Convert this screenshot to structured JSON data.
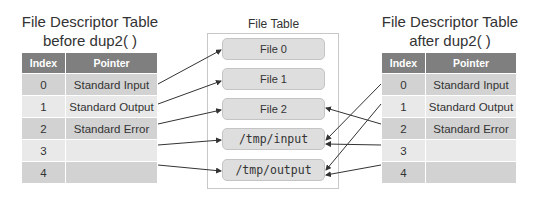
{
  "left_table": {
    "title_line1": "File Descriptor Table",
    "title_line2": "before dup2( )",
    "headers": {
      "index": "Index",
      "pointer": "Pointer"
    },
    "rows": [
      {
        "index": "0",
        "pointer": "Standard Input"
      },
      {
        "index": "1",
        "pointer": "Standard Output"
      },
      {
        "index": "2",
        "pointer": "Standard Error"
      },
      {
        "index": "3",
        "pointer": ""
      },
      {
        "index": "4",
        "pointer": ""
      }
    ]
  },
  "file_table": {
    "label": "File Table",
    "files": [
      {
        "label": "File 0"
      },
      {
        "label": "File 1"
      },
      {
        "label": "File 2"
      },
      {
        "label": "/tmp/input"
      },
      {
        "label": "/tmp/output"
      }
    ]
  },
  "right_table": {
    "title_line1": "File Descriptor Table",
    "title_line2": "after dup2( )",
    "headers": {
      "index": "Index",
      "pointer": "Pointer"
    },
    "rows": [
      {
        "index": "0",
        "pointer": "Standard Input"
      },
      {
        "index": "1",
        "pointer": "Standard Output"
      },
      {
        "index": "2",
        "pointer": "Standard Error"
      },
      {
        "index": "3",
        "pointer": ""
      },
      {
        "index": "4",
        "pointer": ""
      }
    ]
  },
  "arrows": {
    "left": [
      "0 -> File 0",
      "1 -> File 1",
      "2 -> File 2",
      "3 -> /tmp/input",
      "4 -> /tmp/output"
    ],
    "right": [
      "0 -> /tmp/input",
      "1 -> /tmp/output",
      "2 -> File 2",
      "3 -> /tmp/input",
      "4 -> /tmp/output"
    ]
  },
  "colors": {
    "header_bg": "#7f7f7f",
    "row_dark": "#d2d2d2",
    "row_light": "#e9e9e9",
    "file_box": "#dedede",
    "arrow": "#333333"
  }
}
